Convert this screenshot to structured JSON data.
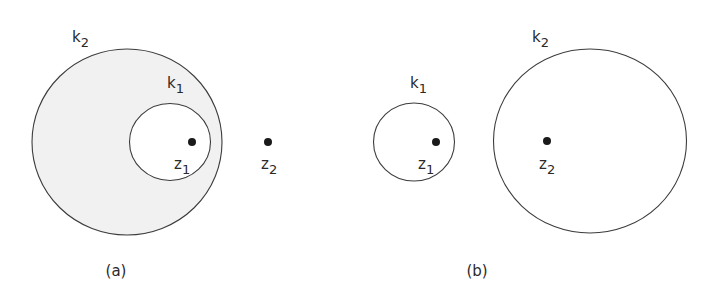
{
  "figure": {
    "panels": [
      {
        "id": "a",
        "caption": "(a)",
        "description": "Circle k1 lies inside circle k2; region between them is shaded. z1 is inside k1; z2 is outside k2.",
        "circles": [
          {
            "name": "k2",
            "label": "k",
            "label_sub": "2",
            "cx": 127,
            "cy": 142,
            "rx": 95,
            "ry": 93,
            "shaded": true
          },
          {
            "name": "k1",
            "label": "k",
            "label_sub": "1",
            "cx": 170,
            "cy": 142,
            "rx": 40.5,
            "ry": 38.5,
            "shaded": false
          }
        ],
        "points": [
          {
            "name": "z1",
            "label": "z",
            "label_sub": "1",
            "x": 192,
            "y": 142
          },
          {
            "name": "z2",
            "label": "z",
            "label_sub": "2",
            "x": 268,
            "y": 142
          }
        ]
      },
      {
        "id": "b",
        "caption": "(b)",
        "description": "Circles k1 and k2 are disjoint; z1 inside k1 and z2 inside k2.",
        "circles": [
          {
            "name": "k1",
            "label": "k",
            "label_sub": "1",
            "cx": 414,
            "cy": 142,
            "rx": 40.5,
            "ry": 39,
            "shaded": false
          },
          {
            "name": "k2",
            "label": "k",
            "label_sub": "2",
            "cx": 590,
            "cy": 141,
            "rx": 96.5,
            "ry": 92,
            "shaded": false
          }
        ],
        "points": [
          {
            "name": "z1",
            "label": "z",
            "label_sub": "1",
            "x": 436,
            "y": 142
          },
          {
            "name": "z2",
            "label": "z",
            "label_sub": "2",
            "x": 547,
            "y": 141
          }
        ]
      }
    ],
    "labels": {
      "a_k2": {
        "main": "k",
        "sub": "2"
      },
      "a_k1": {
        "main": "k",
        "sub": "1"
      },
      "a_z1": {
        "main": "z",
        "sub": "1"
      },
      "a_z2": {
        "main": "z",
        "sub": "2"
      },
      "b_k1": {
        "main": "k",
        "sub": "1"
      },
      "b_k2": {
        "main": "k",
        "sub": "2"
      },
      "b_z1": {
        "main": "z",
        "sub": "1"
      },
      "b_z2": {
        "main": "z",
        "sub": "2"
      },
      "caption_a": "(a)",
      "caption_b": "(b)"
    },
    "colors": {
      "line": "#3c3c3c",
      "shade": "#f1f1f1",
      "dot": "#1a1a1a",
      "background": "#ffffff"
    }
  }
}
